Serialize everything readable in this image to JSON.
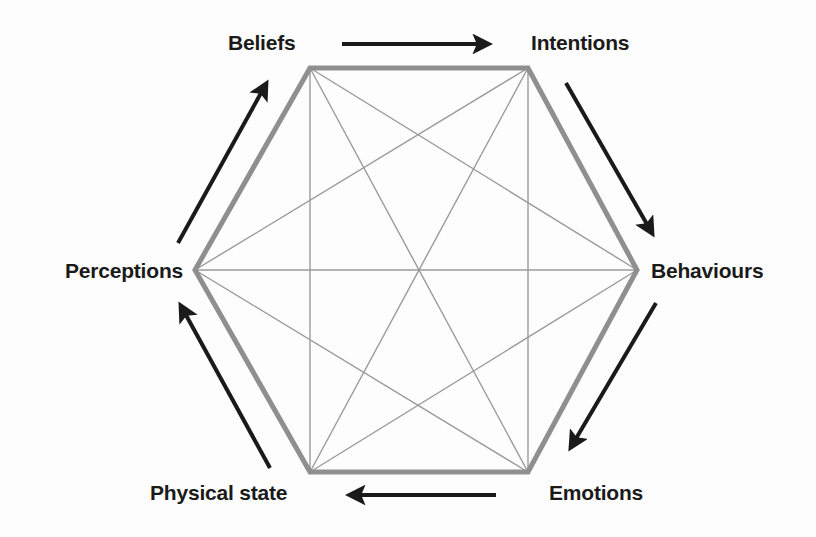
{
  "diagram": {
    "type": "hexagon-cycle",
    "background_color": "#fdfdfd",
    "hexagon_stroke_color": "#8f8f8f",
    "hexagon_stroke_width": 5,
    "inner_line_color": "#9a9a9a",
    "inner_line_width": 1.4,
    "arrow_color": "#1a1a1a",
    "arrow_width": 4,
    "label_color": "#1a1a1a",
    "center": {
      "x": 419,
      "y": 270
    },
    "nodes": [
      {
        "id": "beliefs",
        "label": "Beliefs",
        "vertex": {
          "x": 310,
          "y": 68
        },
        "position": "top-left"
      },
      {
        "id": "intentions",
        "label": "Intentions",
        "vertex": {
          "x": 528,
          "y": 68
        },
        "position": "top-right"
      },
      {
        "id": "behaviours",
        "label": "Behaviours",
        "vertex": {
          "x": 637,
          "y": 270
        },
        "position": "right"
      },
      {
        "id": "emotions",
        "label": "Emotions",
        "vertex": {
          "x": 528,
          "y": 472
        },
        "position": "bottom-right"
      },
      {
        "id": "physical",
        "label": "Physical state",
        "vertex": {
          "x": 310,
          "y": 472
        },
        "position": "bottom-left"
      },
      {
        "id": "perceptions",
        "label": "Perceptions",
        "vertex": {
          "x": 195,
          "y": 270
        },
        "position": "left"
      }
    ],
    "cycle_arrows": [
      {
        "id": "beliefs-to-intentions",
        "from": "beliefs",
        "to": "intentions",
        "x1": 342,
        "y1": 44,
        "x2": 488,
        "y2": 44
      },
      {
        "id": "intentions-to-behaviours",
        "from": "intentions",
        "to": "behaviours",
        "x1": 566,
        "y1": 83,
        "x2": 652,
        "y2": 233
      },
      {
        "id": "behaviours-to-emotions",
        "from": "behaviours",
        "to": "emotions",
        "x1": 656,
        "y1": 303,
        "x2": 571,
        "y2": 447
      },
      {
        "id": "emotions-to-physical",
        "from": "emotions",
        "to": "physical",
        "x1": 496,
        "y1": 495,
        "x2": 350,
        "y2": 495
      },
      {
        "id": "physical-to-perceptions",
        "from": "physical",
        "to": "perceptions",
        "x1": 270,
        "y1": 468,
        "x2": 181,
        "y2": 306
      },
      {
        "id": "perceptions-to-beliefs",
        "from": "perceptions",
        "to": "beliefs",
        "x1": 178,
        "y1": 243,
        "x2": 266,
        "y2": 84
      }
    ],
    "inner_connections": [
      [
        "beliefs",
        "behaviours"
      ],
      [
        "beliefs",
        "emotions"
      ],
      [
        "beliefs",
        "physical"
      ],
      [
        "beliefs",
        "perceptions"
      ],
      [
        "intentions",
        "behaviours"
      ],
      [
        "intentions",
        "emotions"
      ],
      [
        "intentions",
        "physical"
      ],
      [
        "intentions",
        "perceptions"
      ],
      [
        "behaviours",
        "emotions"
      ],
      [
        "behaviours",
        "physical"
      ],
      [
        "behaviours",
        "perceptions"
      ],
      [
        "emotions",
        "physical"
      ],
      [
        "emotions",
        "perceptions"
      ],
      [
        "physical",
        "perceptions"
      ],
      [
        "beliefs",
        "intentions"
      ]
    ]
  }
}
